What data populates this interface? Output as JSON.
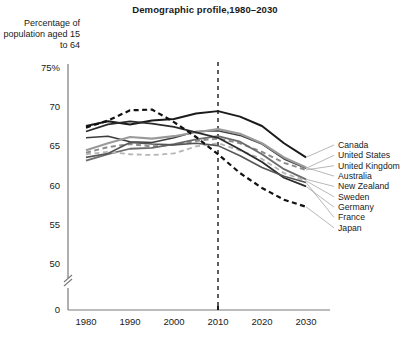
{
  "chart_data": {
    "type": "line",
    "title": "Demographic profile,1980–2030",
    "ylabel": "Percentage of population aged 15 to 64",
    "xlabel": "",
    "ylim": [
      50,
      75
    ],
    "xlim": [
      1980,
      2030
    ],
    "grid": false,
    "legend_position": "right",
    "y_axis_break": true,
    "y_ticks": [
      "75%",
      "70",
      "65",
      "60",
      "55",
      "50",
      "0"
    ],
    "y_tick_values": [
      75,
      70,
      65,
      60,
      55,
      50,
      0
    ],
    "x_ticks": [
      "1980",
      "1990",
      "2000",
      "2010",
      "2020",
      "2030"
    ],
    "x_tick_values": [
      1980,
      1990,
      2000,
      2010,
      2020,
      2030
    ],
    "annotations": [
      {
        "type": "vertical-dashed-line",
        "x": 2010,
        "label": ""
      }
    ],
    "x": [
      1980,
      1985,
      1990,
      1995,
      2000,
      2005,
      2010,
      2015,
      2020,
      2025,
      2030
    ],
    "series": [
      {
        "name": "Canada",
        "style": "solid",
        "color": "#1a1a1a",
        "width": 2.0,
        "values": [
          67.6,
          68.2,
          67.8,
          68.3,
          68.5,
          69.2,
          69.5,
          68.8,
          67.6,
          65.4,
          63.6
        ]
      },
      {
        "name": "United States",
        "style": "solid",
        "color": "#3d3d3d",
        "width": 1.5,
        "values": [
          66.1,
          66.3,
          65.6,
          65.5,
          66.1,
          66.9,
          67.0,
          66.4,
          65.3,
          63.4,
          62.2
        ]
      },
      {
        "name": "United Kingdom",
        "style": "dashed",
        "color": "#8c8c8c",
        "width": 2.0,
        "values": [
          64.2,
          64.9,
          65.3,
          65.0,
          65.2,
          65.7,
          66.0,
          65.4,
          64.3,
          62.9,
          62.0
        ]
      },
      {
        "name": "Australia",
        "style": "solid",
        "color": "#9a9a9a",
        "width": 2.2,
        "values": [
          64.5,
          65.4,
          66.2,
          66.0,
          66.3,
          66.8,
          67.2,
          66.6,
          65.4,
          63.6,
          62.3
        ]
      },
      {
        "name": "New Zealand",
        "style": "solid",
        "color": "#6b6b6b",
        "width": 1.8,
        "values": [
          63.2,
          64.0,
          64.7,
          64.8,
          65.3,
          65.9,
          66.3,
          65.6,
          64.0,
          62.1,
          60.8
        ]
      },
      {
        "name": "Sweden",
        "style": "dashed",
        "color": "#b5b5b5",
        "width": 1.8,
        "values": [
          64.0,
          64.3,
          64.0,
          63.9,
          64.1,
          65.0,
          65.4,
          64.5,
          63.4,
          61.6,
          60.6
        ]
      },
      {
        "name": "Germany",
        "style": "solid",
        "color": "#2b2b2b",
        "width": 1.8,
        "values": [
          66.9,
          67.8,
          68.2,
          67.9,
          67.5,
          66.8,
          66.1,
          64.6,
          63.0,
          61.0,
          59.9
        ]
      },
      {
        "name": "France",
        "style": "solid",
        "color": "#555555",
        "width": 1.6,
        "values": [
          63.6,
          64.1,
          65.5,
          65.3,
          65.2,
          65.4,
          65.1,
          63.8,
          62.3,
          61.2,
          60.4
        ]
      },
      {
        "name": "Japan",
        "style": "dashed",
        "color": "#111111",
        "width": 2.2,
        "values": [
          67.4,
          68.3,
          69.6,
          69.7,
          68.1,
          66.2,
          64.0,
          61.6,
          59.7,
          58.2,
          57.3
        ]
      }
    ]
  }
}
